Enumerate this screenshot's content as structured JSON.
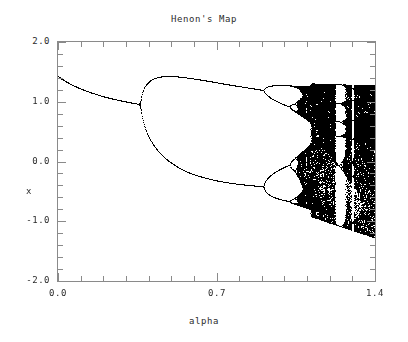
{
  "chart_data": {
    "type": "scatter",
    "title": "Henon's Map",
    "xlabel": "alpha",
    "ylabel": "x",
    "xlim": [
      0.0,
      1.4
    ],
    "ylim": [
      -2.0,
      2.0
    ],
    "grid": false,
    "legend": null,
    "xticks": [
      {
        "value": 0.0,
        "label": "0.0",
        "major": true
      },
      {
        "value": 0.1,
        "label": "",
        "major": false
      },
      {
        "value": 0.2,
        "label": "",
        "major": false
      },
      {
        "value": 0.3,
        "label": "",
        "major": false
      },
      {
        "value": 0.4,
        "label": "",
        "major": false
      },
      {
        "value": 0.5,
        "label": "",
        "major": false
      },
      {
        "value": 0.6,
        "label": "",
        "major": false
      },
      {
        "value": 0.7,
        "label": "0.7",
        "major": true
      },
      {
        "value": 0.8,
        "label": "",
        "major": false
      },
      {
        "value": 0.9,
        "label": "",
        "major": false
      },
      {
        "value": 1.0,
        "label": "",
        "major": false
      },
      {
        "value": 1.1,
        "label": "",
        "major": false
      },
      {
        "value": 1.2,
        "label": "",
        "major": false
      },
      {
        "value": 1.3,
        "label": "",
        "major": false
      },
      {
        "value": 1.4,
        "label": "1.4",
        "major": true
      }
    ],
    "yticks": [
      {
        "value": 2.0,
        "label": "2.0",
        "major": true
      },
      {
        "value": 1.8,
        "label": "",
        "major": false
      },
      {
        "value": 1.6,
        "label": "",
        "major": false
      },
      {
        "value": 1.4,
        "label": "",
        "major": false
      },
      {
        "value": 1.2,
        "label": "",
        "major": false
      },
      {
        "value": 1.0,
        "label": "1.0",
        "major": true
      },
      {
        "value": 0.8,
        "label": "",
        "major": false
      },
      {
        "value": 0.6,
        "label": "",
        "major": false
      },
      {
        "value": 0.4,
        "label": "",
        "major": false
      },
      {
        "value": 0.2,
        "label": "",
        "major": false
      },
      {
        "value": 0.0,
        "label": "0.0",
        "major": true
      },
      {
        "value": -0.2,
        "label": "",
        "major": false
      },
      {
        "value": -0.4,
        "label": "",
        "major": false
      },
      {
        "value": -0.6,
        "label": "",
        "major": false
      },
      {
        "value": -0.8,
        "label": "",
        "major": false
      },
      {
        "value": -1.0,
        "label": "-1.0",
        "major": true
      },
      {
        "value": -1.2,
        "label": "",
        "major": false
      },
      {
        "value": -1.4,
        "label": "",
        "major": false
      },
      {
        "value": -1.6,
        "label": "",
        "major": false
      },
      {
        "value": -1.8,
        "label": "",
        "major": false
      },
      {
        "value": -2.0,
        "label": "-2.0",
        "major": true
      }
    ],
    "map": {
      "name": "henon",
      "equation": "x[n+1] = 1 - alpha*x[n]^2 + y[n], y[n+1] = b*x[n]",
      "b": 0.3,
      "transient_iterations": 300,
      "plot_iterations": 260,
      "alpha_steps": 640,
      "point_color": "#000000"
    },
    "features": [
      {
        "name": "fixed-point-branch",
        "alpha_range": [
          0.0,
          0.3675
        ],
        "x_start": 1.4,
        "x_end": 0.96
      },
      {
        "name": "period-2-branch-upper",
        "alpha_range": [
          0.3675,
          0.9125
        ],
        "x_start": 0.96,
        "x_end": 1.28
      },
      {
        "name": "period-2-branch-lower",
        "alpha_range": [
          0.3675,
          0.9125
        ],
        "x_start": 0.96,
        "x_end": -0.42
      },
      {
        "name": "period-4-onset",
        "alpha_range": [
          0.9125,
          1.025
        ]
      },
      {
        "name": "chaotic-band",
        "alpha_range": [
          1.06,
          1.4
        ],
        "x_min": -1.22,
        "x_max": 1.3
      },
      {
        "name": "periodic-window",
        "alpha_range": [
          1.22,
          1.245
        ]
      },
      {
        "name": "periodic-window",
        "alpha_range": [
          1.27,
          1.29
        ]
      }
    ]
  },
  "axes": {
    "frame_color": "#8a8a8a",
    "text_color": "#2b2b2b"
  }
}
